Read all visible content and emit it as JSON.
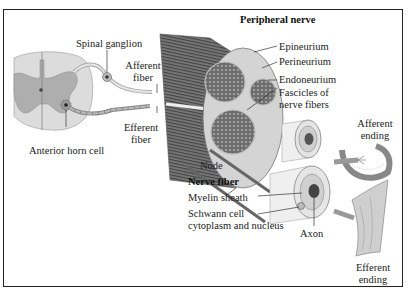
{
  "diagram": {
    "title": "Peripheral nerve",
    "spinal_cord": {
      "labels": {
        "spinal_ganglion": "Spinal ganglion",
        "afferent_fiber_1": "Afferent",
        "afferent_fiber_2": "fiber",
        "efferent_fiber_1": "Efferent",
        "efferent_fiber_2": "fiber",
        "anterior_horn_cell": "Anterior horn cell"
      }
    },
    "nerve_layers": {
      "epineurium": "Epineurium",
      "perineurium": "Perineurium",
      "endoneurium": "Endoneurium",
      "fascicles_1": "Fascicles of",
      "fascicles_2": "nerve fibers"
    },
    "nerve_fiber": {
      "title": "Nerve fiber",
      "node": "Node",
      "myelin_sheath": "Myelin sheath",
      "schwann_1": "Schwann cell",
      "schwann_2": "cytoplasm and nucleus",
      "axon": "Axon"
    },
    "endings": {
      "afferent_1": "Afferent",
      "afferent_2": "ending",
      "efferent_1": "Efferent",
      "efferent_2": "ending"
    },
    "colors": {
      "gray_matter": "#a8a8a8",
      "white_matter": "#d9d9d9",
      "dark_fascicle": "#555555",
      "line": "#333333"
    }
  }
}
